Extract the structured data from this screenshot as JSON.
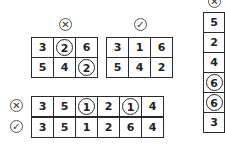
{
  "puzzles": [
    {
      "id": "grid-wrong",
      "status_icon": "cross-icon",
      "rows": [
        [
          "3",
          "2",
          "6"
        ],
        [
          "5",
          "4",
          "2"
        ]
      ],
      "circled": [
        [
          0,
          1
        ],
        [
          1,
          2
        ]
      ]
    },
    {
      "id": "grid-right",
      "status_icon": "check-icon",
      "rows": [
        [
          "3",
          "1",
          "6"
        ],
        [
          "5",
          "4",
          "2"
        ]
      ],
      "circled": []
    },
    {
      "id": "row-wrong",
      "status_icon": "cross-icon",
      "rows": [
        [
          "3",
          "5",
          "1",
          "2",
          "1",
          "4"
        ]
      ],
      "circled": [
        [
          0,
          2
        ],
        [
          0,
          4
        ]
      ]
    },
    {
      "id": "row-right",
      "status_icon": "check-icon",
      "rows": [
        [
          "3",
          "5",
          "1",
          "2",
          "6",
          "4"
        ]
      ],
      "circled": []
    },
    {
      "id": "column-wrong",
      "status_icon": "cross-icon",
      "rows": [
        [
          "5"
        ],
        [
          "2"
        ],
        [
          "4"
        ],
        [
          "6"
        ],
        [
          "6"
        ],
        [
          "3"
        ]
      ],
      "circled": [
        [
          3,
          0
        ],
        [
          4,
          0
        ]
      ]
    }
  ],
  "icons": {
    "cross": "✕",
    "check": "✓"
  }
}
